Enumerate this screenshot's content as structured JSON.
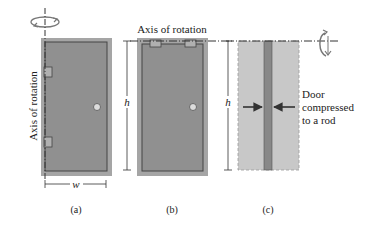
{
  "figure": {
    "panels": [
      {
        "id": "a",
        "caption": "(a)",
        "axis_label": "Axis of rotation",
        "height_label": "h",
        "width_label": "w"
      },
      {
        "id": "b",
        "caption": "(b)",
        "axis_label": "Axis of rotation",
        "height_label": "h"
      },
      {
        "id": "c",
        "caption": "(c)",
        "height_label": "h",
        "annotation_lines": [
          "Door",
          "compressed",
          "to a rod"
        ]
      }
    ],
    "colors": {
      "door_fill": "#8f8f8f",
      "door_frame": "#a8a8a8",
      "door_inner_line": "#4a4a4a",
      "ghost_fill": "#c9c9c9",
      "rod_fill": "#8a8a8a",
      "line": "#333333",
      "knob": "#d8d8d8"
    }
  }
}
